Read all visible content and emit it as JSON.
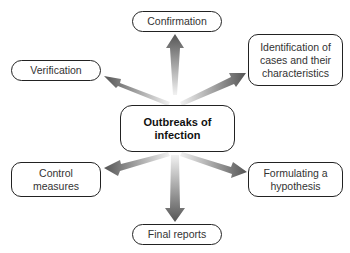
{
  "diagram": {
    "type": "hub-and-spoke",
    "center": {
      "label": "Outbreaks of\ninfection"
    },
    "nodes": [
      {
        "id": "confirmation",
        "label": "Confirmation",
        "position": "top"
      },
      {
        "id": "identification",
        "label": "Identification of\ncases and their\ncharacteristics",
        "position": "top-right"
      },
      {
        "id": "verification",
        "label": "Verification",
        "position": "top-left"
      },
      {
        "id": "control",
        "label": "Control\nmeasures",
        "position": "bottom-left"
      },
      {
        "id": "hypothesis",
        "label": "Formulating a\nhypothesis",
        "position": "bottom-right"
      },
      {
        "id": "final",
        "label": "Final reports",
        "position": "bottom"
      }
    ],
    "arrow_colors": {
      "dark": "#555555",
      "light": "#eeeeee"
    }
  }
}
